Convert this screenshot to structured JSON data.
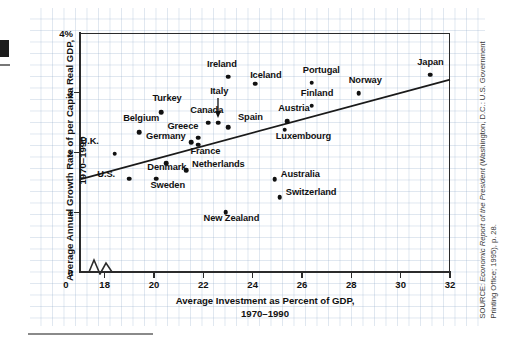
{
  "chart_data": {
    "type": "scatter",
    "title": "",
    "xlabel": "Average Investment as Percent of GDP, 1970–1990",
    "xlabel_line1": "Average Investment as Percent of GDP,",
    "xlabel_line2": "1970–1990",
    "ylabel": "Average Annual Growth Rate of per Capita Real GDP, 1970–1990",
    "ylabel_line1": "Average Annual Growth Rate of per Capita Real GDP,",
    "ylabel_line2": "1970–1990",
    "xlim": [
      17.0,
      32.0
    ],
    "ylim": [
      0,
      4
    ],
    "xticks": [
      18,
      20,
      22,
      24,
      26,
      28,
      30,
      32
    ],
    "xtick_labels": [
      "18",
      "20",
      "22",
      "24",
      "26",
      "28",
      "30",
      "32"
    ],
    "yticks": [
      0,
      1,
      2,
      3,
      4
    ],
    "ytick_labels": [
      "0",
      "1",
      "2",
      "3",
      "4%"
    ],
    "origin_label": "0",
    "axis_break": true,
    "grid": true,
    "legend": null,
    "marker_color": "#111111",
    "trendline": {
      "label": "regression line",
      "x0": 17.0,
      "y0": 1.55,
      "x1": 32.0,
      "y1": 3.22
    },
    "points": [
      {
        "name": "U.K.",
        "x": 18.4,
        "y": 1.98,
        "lx": -34,
        "ly": -12
      },
      {
        "name": "U.S.",
        "x": 19.0,
        "y": 1.56,
        "lx": -32,
        "ly": -4
      },
      {
        "name": "Belgium",
        "x": 19.4,
        "y": 2.34,
        "lx": -16,
        "ly": -13
      },
      {
        "name": "Sweden",
        "x": 20.1,
        "y": 1.56,
        "lx": -6,
        "ly": 7
      },
      {
        "name": "Turkey",
        "x": 20.3,
        "y": 2.67,
        "lx": -9,
        "ly": -13
      },
      {
        "name": "Denmark",
        "x": 20.5,
        "y": 1.82,
        "lx": -19,
        "ly": 5
      },
      {
        "name": "Germany",
        "x": 21.5,
        "y": 2.17,
        "lx": -45,
        "ly": -5
      },
      {
        "name": "Netherlands",
        "x": 21.3,
        "y": 1.7,
        "lx": 6,
        "ly": -5
      },
      {
        "name": "Greece",
        "x": 21.8,
        "y": 2.25,
        "lx": -31,
        "ly": -11
      },
      {
        "name": "France",
        "x": 21.8,
        "y": 2.13,
        "lx": -8,
        "ly": 7
      },
      {
        "name": "Canada",
        "x": 22.2,
        "y": 2.5,
        "lx": -18,
        "ly": -12
      },
      {
        "name": "Italy",
        "x": 22.6,
        "y": 2.5,
        "lx": -8,
        "ly": -31
      },
      {
        "name": "New Zealand",
        "x": 22.9,
        "y": 1.0,
        "lx": -22,
        "ly": 7
      },
      {
        "name": "Spain",
        "x": 23.0,
        "y": 2.42,
        "lx": 10,
        "ly": -9
      },
      {
        "name": "Ireland",
        "x": 23.0,
        "y": 3.27,
        "lx": -21,
        "ly": -12
      },
      {
        "name": "Iceland",
        "x": 24.1,
        "y": 3.15,
        "lx": -5,
        "ly": -8
      },
      {
        "name": "Australia",
        "x": 24.9,
        "y": 1.55,
        "lx": 6,
        "ly": -4
      },
      {
        "name": "Switzerland",
        "x": 25.1,
        "y": 1.25,
        "lx": 6,
        "ly": -4
      },
      {
        "name": "Luxembourg",
        "x": 25.3,
        "y": 2.38,
        "lx": -9,
        "ly": 7
      },
      {
        "name": "Austria",
        "x": 25.4,
        "y": 2.52,
        "lx": -9,
        "ly": -12
      },
      {
        "name": "Finland",
        "x": 26.4,
        "y": 2.78,
        "lx": -11,
        "ly": -12
      },
      {
        "name": "Portugal",
        "x": 26.4,
        "y": 3.17,
        "lx": -9,
        "ly": -12
      },
      {
        "name": "Norway",
        "x": 28.3,
        "y": 2.99,
        "lx": -10,
        "ly": -12
      },
      {
        "name": "Japan",
        "x": 31.2,
        "y": 3.3,
        "lx": -13,
        "ly": -12
      }
    ]
  },
  "source": {
    "prefix": "SOURCE: ",
    "italic": "Economic Report of the President",
    "suffix": " (Washington, D.C.: U.S. Government Printing Office; 1995), p. 28."
  }
}
